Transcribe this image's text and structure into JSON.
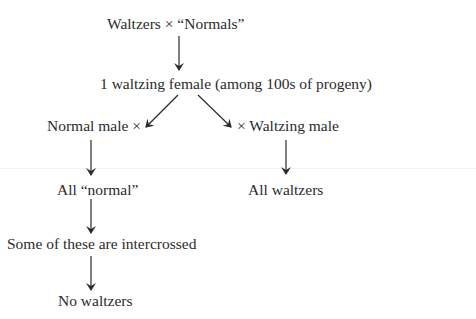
{
  "diagram": {
    "type": "genetic-cross-flowchart",
    "nodes": {
      "parental_cross": "Waltzers  ×  “Normals”",
      "f1_result": "1 waltzing female (among 100s of progeny)",
      "cross_left": "Normal male ×",
      "cross_right": "× Waltzing male",
      "left_result": "All “normal”",
      "right_result": "All waltzers",
      "intercross": "Some of these are intercrossed",
      "final_result": "No waltzers"
    },
    "edges": [
      {
        "from": "parental_cross",
        "to": "f1_result",
        "style": "down-arrow"
      },
      {
        "from": "f1_result",
        "to": "cross_left",
        "style": "diagonal-arrow-left"
      },
      {
        "from": "f1_result",
        "to": "cross_right",
        "style": "diagonal-arrow-right"
      },
      {
        "from": "cross_left",
        "to": "left_result",
        "style": "down-arrow"
      },
      {
        "from": "cross_right",
        "to": "right_result",
        "style": "down-arrow"
      },
      {
        "from": "left_result",
        "to": "intercross",
        "style": "down-arrow"
      },
      {
        "from": "intercross",
        "to": "final_result",
        "style": "down-arrow"
      }
    ],
    "colors": {
      "text": "#2b2b2b",
      "arrow": "#2b2b2b",
      "background": "#ffffff"
    }
  }
}
